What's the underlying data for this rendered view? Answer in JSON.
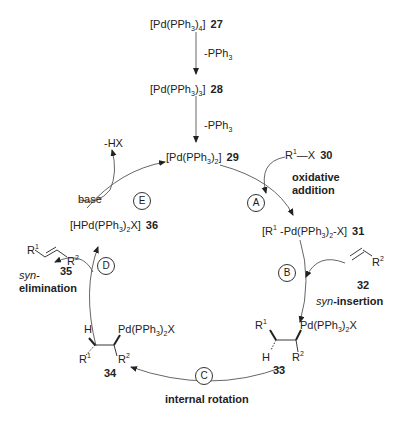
{
  "compounds": {
    "c27": {
      "formula_pre": "[Pd(PPh",
      "sub1": "3",
      "formula_mid": ")",
      "sub2": "4",
      "formula_post": "]",
      "number": "27"
    },
    "c28": {
      "formula_pre": "[Pd(PPh",
      "sub1": "3",
      "formula_mid": ")",
      "sub2": "3",
      "formula_post": "]",
      "number": "28"
    },
    "c29": {
      "formula_pre": "[Pd(PPh",
      "sub1": "3",
      "formula_mid": ")",
      "sub2": "2",
      "formula_post": "]",
      "number": "29"
    },
    "c30": {
      "r": "R",
      "sup": "1",
      "bond": "—X",
      "number": "30"
    },
    "c31": {
      "pre": "[R",
      "sup": "1",
      "mid": " -Pd(PPh",
      "sub1": "3",
      "mid2": ")",
      "sub2": "2",
      "post": "-X]",
      "number": "31"
    },
    "c32": {
      "r": "R",
      "sup": "2",
      "number": "32"
    },
    "c33": {
      "r1": "R",
      "r1sup": "1",
      "h": "H",
      "pd": "Pd(PPh",
      "pdsub1": "3",
      "pdmid": ")",
      "pdsub2": "2",
      "pdpost": "X",
      "r2": "R",
      "r2sup": "2",
      "number": "33"
    },
    "c34": {
      "h": "H",
      "r1": "R",
      "r1sup": "1",
      "pd": "Pd(PPh",
      "pdsub1": "3",
      "pdmid": ")",
      "pdsub2": "2",
      "pdpost": "X",
      "r2": "R",
      "r2sup": "2",
      "number": "34"
    },
    "c35": {
      "r1": "R",
      "r1sup": "1",
      "r2": "R",
      "r2sup": "2",
      "number": "35"
    },
    "c36": {
      "pre": "[HPd(PPh",
      "sub1": "3",
      "mid": ")",
      "sub2": "2",
      "post": "X]",
      "number": "36"
    }
  },
  "reagents": {
    "loss1": {
      "pre": "-PPh",
      "sub": "3"
    },
    "loss2": {
      "pre": "-PPh",
      "sub": "3"
    },
    "hx": "-HX",
    "base": "base"
  },
  "steps": {
    "A": {
      "badge": "A",
      "label_line1": "oxidative",
      "label_line2": "addition"
    },
    "B": {
      "badge": "B",
      "label_italic": "syn",
      "label_rest": "-insertion"
    },
    "C": {
      "badge": "C",
      "label": "internal rotation"
    },
    "D": {
      "badge": "D",
      "label_italic": "syn-",
      "label_rest": "elimination"
    },
    "E": {
      "badge": "E"
    }
  }
}
